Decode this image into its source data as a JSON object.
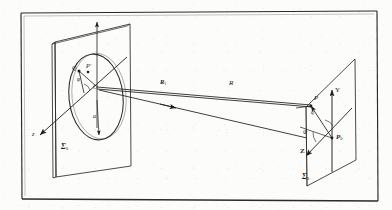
{
  "figure": {
    "domain": "optics-diffraction-geometry",
    "title": "",
    "background_color": "#fcfcfa",
    "ink_color": "#1d1d1d",
    "border": {
      "present": true,
      "style": "double-rule rectangle"
    }
  },
  "labels": {
    "aperture_plane_sigma0": "Σ",
    "aperture_plane_sigma0_sub": "0",
    "observation_plane_sigma": "Σ",
    "observation_plane_sigma_sub": "0",
    "source_point_Q": "Q",
    "aperture_point_Pprime": "P′",
    "aperture_origin_O": "O",
    "aperture_radius_a": "a",
    "aperture_angle_phi": "φ",
    "left_axis_z": "z",
    "ray_R1": "R",
    "ray_R1_sub": "1",
    "ray_R": "R",
    "obs_point_P": "P",
    "obs_origin_P0": "P",
    "obs_origin_P0_sub": "0",
    "obs_axis_Y": "Y",
    "obs_axis_Z": "Z",
    "obs_angle_q": "q",
    "obs_angle_phi": "Φ"
  },
  "geometry": {
    "left_plane_label_pos": "bottom-left of aperture screen",
    "right_plane_label_pos": "bottom-left of observation screen",
    "aperture_shape": "circle",
    "ray_direction": "left-to-right, arrowheads mid-ray",
    "axes_left": [
      "y-up",
      "z-down-left"
    ],
    "axes_right": [
      "Y-up",
      "Z-down-left",
      "X-into-plane"
    ]
  }
}
